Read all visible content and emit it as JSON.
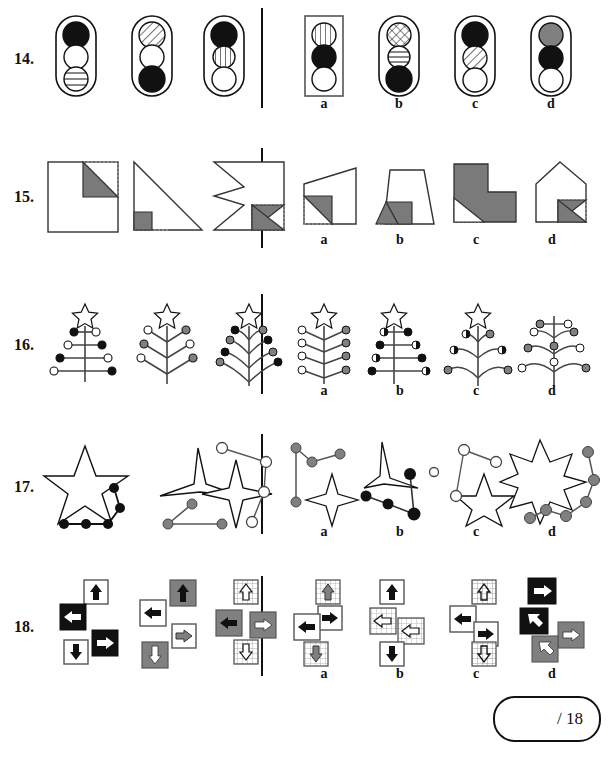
{
  "page": {
    "type": "visual-reasoning-worksheet",
    "score_box": "/ 18",
    "divider_color": "#111111",
    "fill_colors": {
      "black": "#111111",
      "gray": "#808080",
      "white": "#ffffff",
      "shade": "#7a7a7a",
      "dotted": "#999999"
    }
  },
  "rows": [
    {
      "number": "14.",
      "theme": "traffic-light",
      "prompts": [
        {
          "id": "p1",
          "outline": "rounded",
          "box": false,
          "lights": [
            "black",
            "white",
            "striped-h"
          ]
        },
        {
          "id": "p2",
          "outline": "rounded",
          "box": false,
          "lights": [
            "striped-d",
            "white",
            "black"
          ]
        },
        {
          "id": "p3",
          "outline": "rounded",
          "box": false,
          "lights": [
            "black",
            "striped-v",
            "white"
          ]
        }
      ],
      "options": [
        {
          "label": "a",
          "outline": "rect",
          "box": true,
          "lights": [
            "striped-v",
            "black",
            "white"
          ]
        },
        {
          "label": "b",
          "outline": "rounded",
          "box": false,
          "lights": [
            "crosshatch",
            "striped-h",
            "black"
          ]
        },
        {
          "label": "c",
          "outline": "rounded",
          "box": false,
          "lights": [
            "black",
            "striped-d",
            "white"
          ]
        },
        {
          "label": "d",
          "outline": "rounded",
          "box": false,
          "lights": [
            "gray",
            "black",
            "white"
          ]
        }
      ]
    },
    {
      "number": "15.",
      "theme": "folded-shape",
      "prompts": [
        {
          "id": "p1",
          "shape": "square",
          "note": "square with shaded triangle top-right, dotted corner"
        },
        {
          "id": "p2",
          "shape": "right-triangle",
          "note": "right triangle with shaded small square bottom-left, dotted base"
        },
        {
          "id": "p3",
          "shape": "arrow-notch",
          "note": "notched square with shaded triangle bottom-right, dotted corner"
        }
      ],
      "options": [
        {
          "label": "a",
          "shape": "trapezoid-right",
          "note": "slanted quad, shaded triangle lower-left, dotted corner"
        },
        {
          "label": "b",
          "shape": "trapezoid",
          "note": "trapezoid with shaded triangle at base, dotted corner"
        },
        {
          "label": "c",
          "shape": "L-shape",
          "note": "L polygon shaded gray, dotted corner lower-left"
        },
        {
          "label": "d",
          "shape": "house",
          "note": "pentagon house, shaded triangle lower-right"
        }
      ]
    },
    {
      "number": "16.",
      "theme": "christmas-tree",
      "prompts": [
        {
          "id": "p1",
          "style": "straight-branches",
          "star": "open",
          "baubles": "black-and-white alternating, 4 tiers"
        },
        {
          "id": "p2",
          "style": "v-branches",
          "star": "open",
          "baubles": "white and gray, 3 tiers"
        },
        {
          "id": "p3",
          "style": "curved-branches",
          "star": "open",
          "baubles": "black and gray, 4 tiers"
        }
      ],
      "options": [
        {
          "label": "a",
          "style": "v-branches",
          "star": "open",
          "baubles": "white left, gray right, 4 tiers"
        },
        {
          "label": "b",
          "style": "straight-branches",
          "star": "open",
          "baubles": "black and half-filled, 4 tiers"
        },
        {
          "label": "c",
          "style": "curved-branches",
          "star": "open",
          "baubles": "half-filled and gray, 3 tiers"
        },
        {
          "label": "d",
          "style": "curved-branches",
          "star": "none",
          "baubles": "gray and white, 4 tiers"
        }
      ]
    },
    {
      "number": "17.",
      "theme": "star-constellation",
      "prompts": [
        {
          "id": "p1",
          "star": "5-point-large",
          "dots": "4 black dots in a row plus elbow, black",
          "dot_color": "black"
        },
        {
          "id": "p2",
          "star": "3-point",
          "dots": "3 gray dots, elbow path",
          "dot_color": "gray"
        },
        {
          "id": "p3",
          "star": "4-point",
          "dots": "4 white dots, zigzag path",
          "dot_color": "white"
        }
      ],
      "options": [
        {
          "label": "a",
          "star": "4-point",
          "dots": "4 gray dots, bent path",
          "dot_color": "gray"
        },
        {
          "label": "b",
          "star": "3-point",
          "dots": "4 black dots, bent path",
          "dot_color": "black"
        },
        {
          "label": "c",
          "star": "5-point",
          "dots": "4 white dots, bent path + lone dot",
          "dot_color": "white"
        },
        {
          "label": "d",
          "star": "6-point",
          "dots": "6 gray dots, arc path",
          "dot_color": "gray"
        }
      ]
    },
    {
      "number": "18.",
      "theme": "arrow-tiles",
      "prompts": [
        {
          "id": "p1",
          "tiles": [
            {
              "dir": "up",
              "bg": "white",
              "arrow": "black"
            },
            {
              "dir": "left",
              "bg": "black",
              "arrow": "white"
            },
            {
              "dir": "right",
              "bg": "black",
              "arrow": "white"
            },
            {
              "dir": "down",
              "bg": "white",
              "arrow": "black"
            }
          ]
        },
        {
          "id": "p2",
          "tiles": [
            {
              "dir": "up",
              "bg": "gray",
              "arrow": "black"
            },
            {
              "dir": "left",
              "bg": "white",
              "arrow": "black"
            },
            {
              "dir": "right",
              "bg": "white",
              "arrow": "gray"
            },
            {
              "dir": "down",
              "bg": "gray",
              "arrow": "white"
            }
          ]
        },
        {
          "id": "p3",
          "tiles": [
            {
              "dir": "up",
              "bg": "white",
              "arrow": "outline"
            },
            {
              "dir": "left",
              "bg": "gray",
              "arrow": "black"
            },
            {
              "dir": "right",
              "bg": "gray",
              "arrow": "white"
            },
            {
              "dir": "down",
              "bg": "white",
              "arrow": "outline"
            }
          ]
        }
      ],
      "options": [
        {
          "label": "a",
          "tiles": [
            {
              "dir": "up",
              "bg": "white",
              "arrow": "gray"
            },
            {
              "dir": "left",
              "bg": "white",
              "arrow": "black"
            },
            {
              "dir": "right",
              "bg": "white",
              "arrow": "black"
            },
            {
              "dir": "down",
              "bg": "white",
              "arrow": "gray"
            }
          ]
        },
        {
          "label": "b",
          "tiles": [
            {
              "dir": "up",
              "bg": "white",
              "arrow": "black"
            },
            {
              "dir": "left",
              "bg": "white",
              "arrow": "outline"
            },
            {
              "dir": "right",
              "bg": "white",
              "arrow": "outline"
            },
            {
              "dir": "down",
              "bg": "white",
              "arrow": "black"
            }
          ]
        },
        {
          "label": "c",
          "tiles": [
            {
              "dir": "up",
              "bg": "white",
              "arrow": "outline"
            },
            {
              "dir": "left",
              "bg": "white",
              "arrow": "black"
            },
            {
              "dir": "right",
              "bg": "white",
              "arrow": "black"
            },
            {
              "dir": "down",
              "bg": "white",
              "arrow": "outline"
            }
          ]
        },
        {
          "label": "d",
          "tiles": [
            {
              "dir": "right",
              "bg": "black",
              "arrow": "white"
            },
            {
              "dir": "up-left",
              "bg": "black",
              "arrow": "white"
            },
            {
              "dir": "right",
              "bg": "gray",
              "arrow": "white"
            },
            {
              "dir": "up-left",
              "bg": "gray",
              "arrow": "white"
            }
          ]
        }
      ]
    }
  ]
}
